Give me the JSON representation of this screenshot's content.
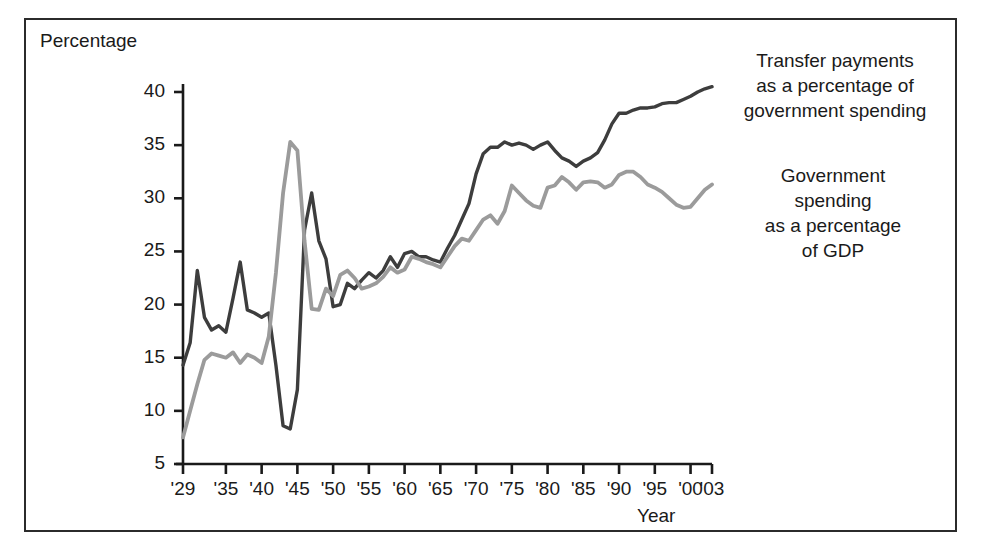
{
  "axes": {
    "ylabel": "Percentage",
    "xlabel": "Year",
    "ytick_labels": [
      "40",
      "35",
      "30",
      "25",
      "20",
      "15",
      "10",
      "5"
    ],
    "xtick_labels": [
      "'29",
      "'35",
      "'40",
      "'45",
      "'50",
      "'55",
      "'60",
      "'65",
      "'70",
      "'75",
      "'80",
      "'85",
      "'90",
      "'95",
      "'00",
      "'03"
    ]
  },
  "legend": {
    "dark": "Transfer payments as a percentage of government spending",
    "dark_lines": [
      "Transfer payments",
      "as a percentage of",
      "government spending"
    ],
    "gray": "Government spending as a percentage of GDP",
    "gray_lines": [
      "Government",
      "spending",
      "as a percentage",
      "of GDP"
    ]
  },
  "colors": {
    "dark_series": "#3d3d3d",
    "gray_series": "#9b9b9b",
    "axis": "#1a1a1a",
    "frame": "#2b2b2b",
    "background": "#ffffff"
  },
  "chart_data": {
    "type": "line",
    "title": "",
    "xlabel": "Year",
    "ylabel": "Percentage",
    "xlim": [
      1929,
      2003
    ],
    "ylim": [
      5,
      40
    ],
    "ytick_values": [
      5,
      10,
      15,
      20,
      25,
      30,
      35,
      40
    ],
    "xtick_values": [
      1929,
      1935,
      1940,
      1945,
      1950,
      1955,
      1960,
      1965,
      1970,
      1975,
      1980,
      1985,
      1990,
      1995,
      2000,
      2003
    ],
    "grid": false,
    "legend_position": "right-inside-labels",
    "x": [
      1929,
      1930,
      1931,
      1932,
      1933,
      1934,
      1935,
      1936,
      1937,
      1938,
      1939,
      1940,
      1941,
      1942,
      1943,
      1944,
      1945,
      1946,
      1947,
      1948,
      1949,
      1950,
      1951,
      1952,
      1953,
      1954,
      1955,
      1956,
      1957,
      1958,
      1959,
      1960,
      1961,
      1962,
      1963,
      1964,
      1965,
      1966,
      1967,
      1968,
      1969,
      1970,
      1971,
      1972,
      1973,
      1974,
      1975,
      1976,
      1977,
      1978,
      1979,
      1980,
      1981,
      1982,
      1983,
      1984,
      1985,
      1986,
      1987,
      1988,
      1989,
      1990,
      1991,
      1992,
      1993,
      1994,
      1995,
      1996,
      1997,
      1998,
      1999,
      2000,
      2001,
      2002,
      2003
    ],
    "series": [
      {
        "name": "Transfer payments as a percentage of government spending",
        "color": "#3d3d3d",
        "values": [
          14.3,
          16.4,
          23.2,
          18.8,
          17.6,
          18.0,
          17.4,
          20.6,
          24.0,
          19.5,
          19.2,
          18.8,
          19.2,
          14.3,
          8.6,
          8.3,
          12.0,
          27.0,
          30.5,
          26.0,
          24.3,
          19.8,
          20.0,
          22.0,
          21.5,
          22.3,
          23.0,
          22.5,
          23.2,
          24.5,
          23.5,
          24.8,
          25.0,
          24.5,
          24.5,
          24.2,
          24.0,
          25.3,
          26.5,
          28.0,
          29.5,
          32.3,
          34.2,
          34.8,
          34.8,
          35.3,
          35.0,
          35.2,
          35.0,
          34.6,
          35.0,
          35.3,
          34.5,
          33.8,
          33.5,
          33.0,
          33.5,
          33.8,
          34.3,
          35.5,
          37.0,
          38.0,
          38.0,
          38.3,
          38.5,
          38.5,
          38.6,
          38.9,
          39.0,
          39.0,
          39.3,
          39.6,
          40.0,
          40.3,
          40.5
        ]
      },
      {
        "name": "Government spending as a percentage of GDP",
        "color": "#9b9b9b",
        "values": [
          7.5,
          10.0,
          12.5,
          14.8,
          15.4,
          15.2,
          15.0,
          15.5,
          14.5,
          15.3,
          15.0,
          14.5,
          17.0,
          23.0,
          30.5,
          35.3,
          34.5,
          26.0,
          19.6,
          19.5,
          21.5,
          20.8,
          22.8,
          23.2,
          22.5,
          21.5,
          21.7,
          22.0,
          22.6,
          23.5,
          23.0,
          23.3,
          24.5,
          24.3,
          24.0,
          23.8,
          23.5,
          24.5,
          25.5,
          26.2,
          26.0,
          27.0,
          28.0,
          28.4,
          27.6,
          28.8,
          31.2,
          30.5,
          29.8,
          29.3,
          29.1,
          31.0,
          31.2,
          32.0,
          31.5,
          30.8,
          31.5,
          31.6,
          31.5,
          31.0,
          31.3,
          32.2,
          32.5,
          32.5,
          32.0,
          31.3,
          31.0,
          30.6,
          30.0,
          29.4,
          29.1,
          29.2,
          30.0,
          30.8,
          31.3
        ]
      }
    ]
  }
}
